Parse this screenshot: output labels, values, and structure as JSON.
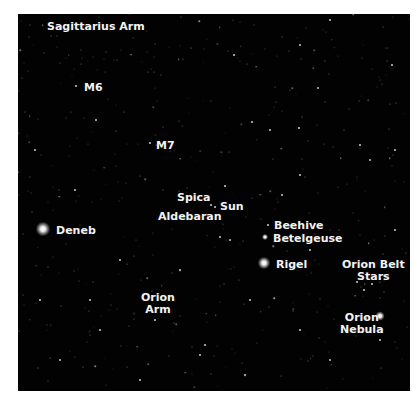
{
  "labels": [
    {
      "id": "sagittarius-arm",
      "text": "Sagittarius Arm",
      "x": 47,
      "y": 21
    },
    {
      "id": "m6",
      "text": "M6",
      "x": 84,
      "y": 82
    },
    {
      "id": "m7",
      "text": "M7",
      "x": 156,
      "y": 140
    },
    {
      "id": "spica",
      "text": "Spica",
      "x": 177,
      "y": 192
    },
    {
      "id": "sun",
      "text": "Sun",
      "x": 220,
      "y": 201
    },
    {
      "id": "aldebaran",
      "text": "Aldebaran",
      "x": 158,
      "y": 211
    },
    {
      "id": "deneb",
      "text": "Deneb",
      "x": 56,
      "y": 225
    },
    {
      "id": "beehive",
      "text": "Beehive",
      "x": 274,
      "y": 220
    },
    {
      "id": "betelgeuse",
      "text": "Betelgeuse",
      "x": 273,
      "y": 233
    },
    {
      "id": "rigel",
      "text": "Rigel",
      "x": 276,
      "y": 259
    },
    {
      "id": "orion-belt-stars",
      "text": "Orion Belt\nStars",
      "x": 342,
      "y": 259
    },
    {
      "id": "orion-arm",
      "text": "Orion\nArm",
      "x": 141,
      "y": 292
    },
    {
      "id": "orion-nebula",
      "text": "Orion\nNebula",
      "x": 340,
      "y": 312
    }
  ],
  "bright_stars": [
    {
      "name": "deneb",
      "x": 43,
      "y": 229,
      "size": 14
    },
    {
      "name": "rigel",
      "x": 264,
      "y": 263,
      "size": 12
    },
    {
      "name": "betelgeuse",
      "x": 265,
      "y": 237,
      "size": 6
    },
    {
      "name": "orion-nebula",
      "x": 380,
      "y": 316,
      "size": 9
    }
  ],
  "dim_stars": [
    [
      76,
      86
    ],
    [
      96,
      120
    ],
    [
      150,
      143
    ],
    [
      215,
      207
    ],
    [
      225,
      186
    ],
    [
      252,
      122
    ],
    [
      234,
      55
    ],
    [
      300,
      45
    ],
    [
      318,
      88
    ],
    [
      299,
      128
    ],
    [
      392,
      65
    ],
    [
      370,
      160
    ],
    [
      300,
      175
    ],
    [
      282,
      195
    ],
    [
      211,
      205
    ],
    [
      268,
      225
    ],
    [
      357,
      282
    ],
    [
      364,
      290
    ],
    [
      372,
      284
    ],
    [
      380,
      279
    ],
    [
      230,
      240
    ],
    [
      220,
      237
    ],
    [
      75,
      190
    ],
    [
      40,
      300
    ],
    [
      100,
      330
    ],
    [
      155,
      320
    ],
    [
      200,
      355
    ],
    [
      250,
      300
    ],
    [
      330,
      360
    ],
    [
      380,
      340
    ],
    [
      120,
      260
    ],
    [
      180,
      270
    ],
    [
      300,
      330
    ],
    [
      60,
      360
    ],
    [
      140,
      380
    ],
    [
      395,
      230
    ],
    [
      360,
      145
    ],
    [
      330,
      20
    ],
    [
      395,
      150
    ],
    [
      270,
      130
    ],
    [
      205,
      345
    ],
    [
      90,
      300
    ],
    [
      245,
      375
    ],
    [
      310,
      250
    ],
    [
      35,
      150
    ]
  ]
}
